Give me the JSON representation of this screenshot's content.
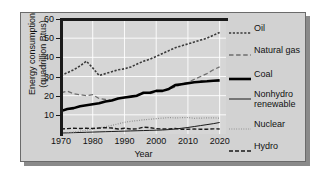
{
  "chart_data": {
    "type": "line",
    "title": "",
    "xlabel": "Year",
    "ylabel": "Energy consumption\n(quadrillion Btus)",
    "xlim": [
      1970,
      2022
    ],
    "ylim": [
      0,
      60
    ],
    "xticks": [
      "1970",
      "1980",
      "1990",
      "2000",
      "2010",
      "2020"
    ],
    "xtick_values": [
      1970,
      1980,
      1990,
      2000,
      2010,
      2020
    ],
    "yticks": [
      "10",
      "20",
      "30",
      "40",
      "50",
      "60"
    ],
    "ytick_values": [
      10,
      20,
      30,
      40,
      50,
      60
    ],
    "grid": true,
    "legend_position": "right",
    "x": [
      1970,
      1972,
      1974,
      1976,
      1978,
      1980,
      1982,
      1984,
      1986,
      1988,
      1990,
      1992,
      1994,
      1996,
      1998,
      2000,
      2002,
      2004,
      2006,
      2008,
      2010,
      2012,
      2014,
      2016,
      2018,
      2020
    ],
    "series": [
      {
        "name": "Oil",
        "style": "short-dash",
        "color": "#3a3a3a",
        "width": 1.6,
        "values": [
          30.5,
          32.0,
          33.5,
          35.5,
          38.0,
          34.5,
          30.5,
          31.5,
          32.5,
          33.5,
          34.0,
          35.0,
          36.5,
          38.0,
          39.0,
          40.5,
          42.0,
          43.5,
          45.0,
          46.0,
          47.0,
          48.0,
          49.0,
          50.0,
          51.5,
          53.0
        ]
      },
      {
        "name": "Natural gas",
        "style": "long-dash",
        "color": "#6e6e6e",
        "width": 1.3,
        "values": [
          21.5,
          22.3,
          21.0,
          20.5,
          20.0,
          20.5,
          18.5,
          18.0,
          17.5,
          18.5,
          19.0,
          19.5,
          20.5,
          21.5,
          21.0,
          22.0,
          22.5,
          23.5,
          24.5,
          26.0,
          27.0,
          28.5,
          30.0,
          31.5,
          33.5,
          35.0
        ]
      },
      {
        "name": "Coal",
        "style": "solid-thick",
        "color": "#000000",
        "width": 2.6,
        "values": [
          12.0,
          13.0,
          13.5,
          14.5,
          15.0,
          15.5,
          16.0,
          17.0,
          17.5,
          18.5,
          19.0,
          19.5,
          20.0,
          21.5,
          21.5,
          22.5,
          22.5,
          23.5,
          25.5,
          26.0,
          26.5,
          27.0,
          27.3,
          27.5,
          27.8,
          28.0
        ]
      },
      {
        "name": "Nonhydro\nrenewable",
        "style": "solid-thin",
        "color": "#1a1a1a",
        "width": 1.0,
        "values": [
          0.5,
          0.6,
          0.7,
          0.8,
          0.9,
          1.0,
          1.1,
          1.2,
          1.3,
          1.4,
          1.5,
          1.6,
          1.7,
          1.8,
          1.9,
          2.0,
          2.1,
          2.3,
          2.6,
          3.0,
          3.4,
          3.9,
          4.4,
          4.9,
          5.4,
          6.0
        ]
      },
      {
        "name": "Nuclear",
        "style": "dotted",
        "color": "#8c8c8c",
        "width": 1.2,
        "values": [
          0.3,
          0.6,
          1.0,
          1.5,
          2.0,
          2.6,
          3.2,
          3.8,
          4.5,
          5.3,
          6.1,
          6.6,
          7.0,
          7.4,
          7.7,
          8.0,
          8.3,
          8.6,
          8.4,
          8.5,
          8.6,
          8.2,
          8.3,
          8.4,
          8.4,
          8.3
        ]
      },
      {
        "name": "Hydro",
        "style": "dash-dot",
        "color": "#1a1a1a",
        "width": 1.4,
        "values": [
          2.6,
          2.8,
          3.0,
          2.9,
          3.0,
          2.9,
          3.1,
          3.3,
          3.1,
          2.6,
          3.0,
          2.6,
          2.7,
          3.6,
          3.3,
          2.8,
          2.6,
          2.7,
          2.9,
          2.5,
          2.5,
          2.6,
          2.5,
          2.5,
          2.7,
          2.6
        ]
      }
    ],
    "legend_entries": [
      {
        "label": "Oil",
        "style": "short-dash"
      },
      {
        "label": "Natural gas",
        "style": "long-dash"
      },
      {
        "label": "Coal",
        "style": "solid-thick"
      },
      {
        "label": "Nonhydro\nrenewable",
        "style": "solid-thin"
      },
      {
        "label": "Nuclear",
        "style": "dotted"
      },
      {
        "label": "Hydro",
        "style": "dash-dot"
      }
    ]
  }
}
